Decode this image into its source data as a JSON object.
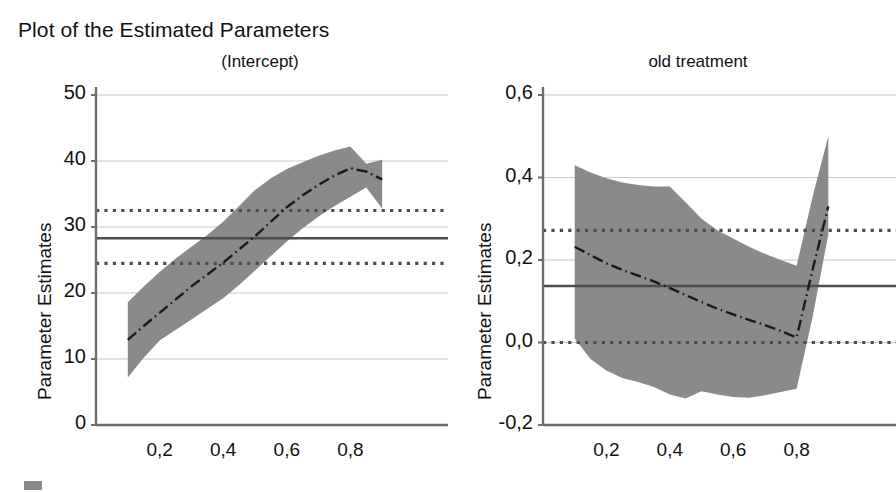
{
  "figure": {
    "main_title": "Plot of the Estimated Parameters",
    "y_axis_label": "Parameter Estimates",
    "band_color": "#8a8a8a",
    "estimate_line_color": "#1a1a1a",
    "reference_line_color": "#4d4d4d",
    "grid_color": "#c8c8c8",
    "axis_color": "#6e6e6e",
    "background": "#ffffff"
  },
  "legend": {
    "swatch_name": "confidence-band-swatch",
    "swatch_color": "#8a8a8a"
  },
  "chart_data": [
    {
      "type": "line",
      "panel_id": "intercept",
      "title": "(Intercept)",
      "xlabel": "",
      "ylabel": "Parameter Estimates",
      "xlim": [
        0.0,
        1.0
      ],
      "ylim": [
        0,
        50
      ],
      "grid": true,
      "legend_position": "bottom-left",
      "y_ticks": [
        "0",
        "10",
        "20",
        "30",
        "40",
        "50"
      ],
      "y_tick_values": [
        0,
        10,
        20,
        30,
        40,
        50
      ],
      "x_ticks": [
        "0,2",
        "0,4",
        "0,6",
        "0,8"
      ],
      "x_tick_values": [
        0.2,
        0.4,
        0.6,
        0.8
      ],
      "x": [
        0.1,
        0.15,
        0.2,
        0.25,
        0.3,
        0.35,
        0.4,
        0.45,
        0.5,
        0.55,
        0.6,
        0.65,
        0.7,
        0.75,
        0.8,
        0.85,
        0.9
      ],
      "series": [
        {
          "name": "Estimate",
          "style": "dash-dot",
          "values": [
            12.9,
            15.0,
            17.0,
            19.0,
            21.0,
            22.8,
            24.6,
            26.6,
            28.6,
            30.8,
            33.0,
            34.8,
            36.4,
            37.8,
            38.9,
            38.4,
            37.2
          ]
        },
        {
          "name": "Upper confidence limit",
          "style": "band-upper",
          "values": [
            18.6,
            21.0,
            23.2,
            25.2,
            27.0,
            28.8,
            30.8,
            33.2,
            35.6,
            37.4,
            38.8,
            39.8,
            40.8,
            41.6,
            42.2,
            39.6,
            40.2
          ]
        },
        {
          "name": "Lower confidence limit",
          "style": "band-lower",
          "values": [
            7.2,
            10.2,
            12.8,
            14.4,
            16.0,
            17.6,
            19.2,
            21.2,
            23.4,
            25.6,
            27.8,
            29.8,
            31.6,
            33.2,
            34.6,
            36.0,
            32.8
          ]
        }
      ],
      "reference_lines": [
        {
          "name": "upper-reference",
          "style": "dotted",
          "value": 32.5
        },
        {
          "name": "mean-reference",
          "style": "solid",
          "value": 28.3
        },
        {
          "name": "lower-reference",
          "style": "dotted",
          "value": 24.5
        }
      ]
    },
    {
      "type": "line",
      "panel_id": "old-treatment",
      "title": "old treatment",
      "xlabel": "",
      "ylabel": "Parameter Estimates",
      "xlim": [
        0.0,
        1.0
      ],
      "ylim": [
        -0.2,
        0.6
      ],
      "grid": true,
      "legend_position": "bottom-left",
      "y_ticks": [
        "-0,2",
        "0,0",
        "0,2",
        "0,4",
        "0,6"
      ],
      "y_tick_values": [
        -0.2,
        0.0,
        0.2,
        0.4,
        0.6
      ],
      "x_ticks": [
        "0,2",
        "0,4",
        "0,6",
        "0,8"
      ],
      "x_tick_values": [
        0.2,
        0.4,
        0.6,
        0.8
      ],
      "x": [
        0.1,
        0.15,
        0.2,
        0.25,
        0.3,
        0.35,
        0.4,
        0.45,
        0.5,
        0.55,
        0.6,
        0.65,
        0.7,
        0.75,
        0.8,
        0.85,
        0.9
      ],
      "series": [
        {
          "name": "Estimate",
          "style": "dash-dot",
          "values": [
            0.232,
            0.212,
            0.192,
            0.176,
            0.162,
            0.148,
            0.132,
            0.115,
            0.098,
            0.082,
            0.068,
            0.055,
            0.042,
            0.028,
            0.012,
            0.175,
            0.33
          ]
        },
        {
          "name": "Upper confidence limit",
          "style": "band-upper",
          "values": [
            0.43,
            0.412,
            0.398,
            0.388,
            0.382,
            0.378,
            0.378,
            0.34,
            0.3,
            0.272,
            0.252,
            0.232,
            0.215,
            0.2,
            0.186,
            0.352,
            0.5
          ]
        },
        {
          "name": "Lower confidence limit",
          "style": "band-lower",
          "values": [
            0.01,
            -0.04,
            -0.068,
            -0.086,
            -0.096,
            -0.108,
            -0.126,
            -0.136,
            -0.118,
            -0.126,
            -0.132,
            -0.134,
            -0.128,
            -0.12,
            -0.112,
            0.06,
            0.262
          ]
        }
      ],
      "reference_lines": [
        {
          "name": "upper-reference",
          "style": "dotted",
          "value": 0.272
        },
        {
          "name": "mean-reference",
          "style": "solid",
          "value": 0.137
        },
        {
          "name": "lower-reference",
          "style": "dotted",
          "value": 0.0
        }
      ]
    }
  ]
}
